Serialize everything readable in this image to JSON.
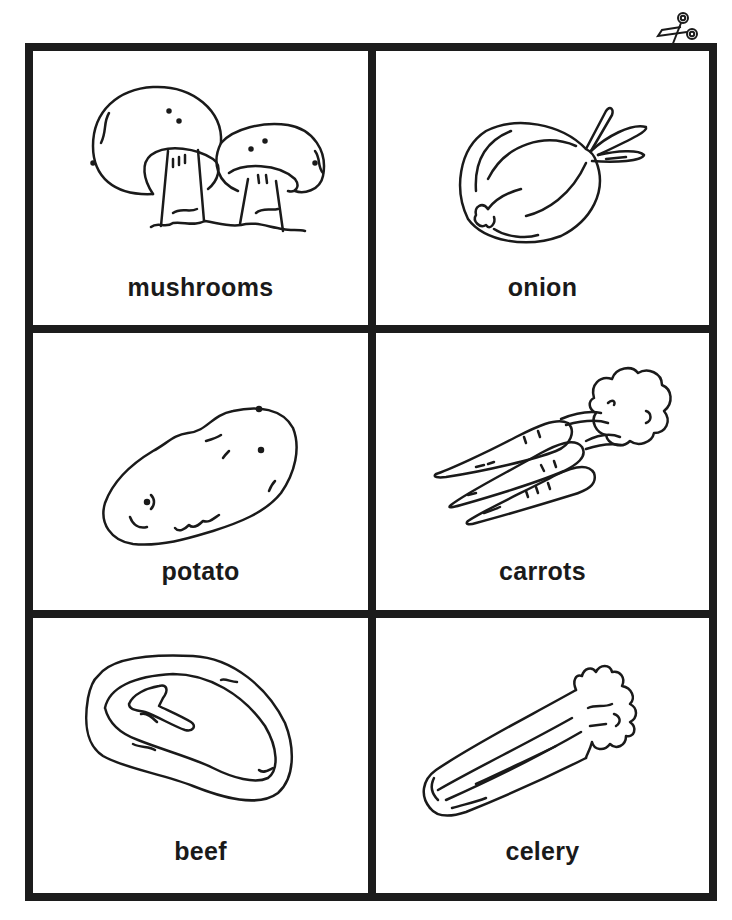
{
  "page": {
    "background": "#ffffff",
    "line_color": "#1c1c1c"
  },
  "cut_marker": {
    "icon": "scissors-icon"
  },
  "cards": [
    {
      "id": "mushrooms",
      "label": "mushrooms",
      "icon": "mushrooms-illustration"
    },
    {
      "id": "onion",
      "label": "onion",
      "icon": "onion-illustration"
    },
    {
      "id": "potato",
      "label": "potato",
      "icon": "potato-illustration"
    },
    {
      "id": "carrots",
      "label": "carrots",
      "icon": "carrots-illustration"
    },
    {
      "id": "beef",
      "label": "beef",
      "icon": "beef-illustration"
    },
    {
      "id": "celery",
      "label": "celery",
      "icon": "celery-illustration"
    }
  ]
}
